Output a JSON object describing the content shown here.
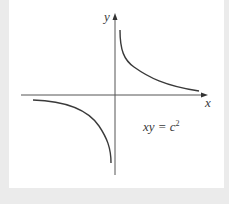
{
  "figure": {
    "type": "diagram",
    "title": "",
    "axes": {
      "x_label": "x",
      "y_label": "y",
      "origin": "center"
    },
    "equation": {
      "lhs": "xy = c",
      "superscript": "2",
      "full": "xy = c²"
    },
    "curves": [
      {
        "name": "hyperbola-branch-first-quadrant",
        "quadrant": 1
      },
      {
        "name": "hyperbola-branch-third-quadrant",
        "quadrant": 3
      }
    ],
    "colors": {
      "background": "#ebebeb",
      "panel": "#ffffff",
      "axis": "#555555",
      "curve": "#3a3a3a"
    }
  }
}
